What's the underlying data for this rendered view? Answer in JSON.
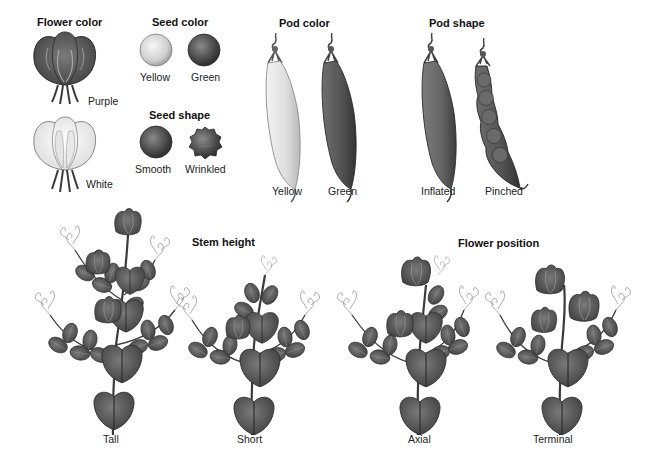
{
  "traits": {
    "flower_color": {
      "heading": "Flower color",
      "variants": [
        {
          "label": "Purple",
          "shade": "#4a4a4a"
        },
        {
          "label": "White",
          "shade": "#ececec"
        }
      ]
    },
    "seed_color": {
      "heading": "Seed color",
      "variants": [
        {
          "label": "Yellow",
          "shade": "#d8d8d8"
        },
        {
          "label": "Green",
          "shade": "#555555"
        }
      ]
    },
    "seed_shape": {
      "heading": "Seed shape",
      "variants": [
        {
          "label": "Smooth",
          "shade": "#5a5a5a"
        },
        {
          "label": "Wrinkled",
          "shade": "#5e5e5e"
        }
      ]
    },
    "pod_color": {
      "heading": "Pod color",
      "variants": [
        {
          "label": "Yellow",
          "shade": "#e4e4e4"
        },
        {
          "label": "Green",
          "shade": "#5a5a5a"
        }
      ]
    },
    "pod_shape": {
      "heading": "Pod shape",
      "variants": [
        {
          "label": "Inflated",
          "shade": "#6a6a6a"
        },
        {
          "label": "Pinched",
          "shade": "#4a4a4a"
        }
      ]
    },
    "stem_height": {
      "heading": "Stem height",
      "variants": [
        {
          "label": "Tall"
        },
        {
          "label": "Short"
        }
      ]
    },
    "flower_position": {
      "heading": "Flower position",
      "variants": [
        {
          "label": "Axial"
        },
        {
          "label": "Terminal"
        }
      ]
    }
  },
  "colors": {
    "background": "#ffffff",
    "ink": "#1a1a1a",
    "leaf": "#585858",
    "leaf_dark": "#333333",
    "tendril": "#8a8a8a"
  }
}
